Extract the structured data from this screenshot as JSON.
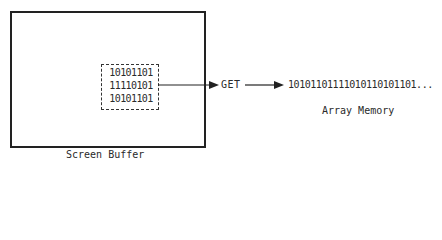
{
  "diagram": {
    "screen_buffer": {
      "label": "Screen Buffer",
      "selected_bits": [
        "10101101",
        "11110101",
        "10101101"
      ]
    },
    "operation": {
      "label": "GET"
    },
    "array_memory": {
      "label": "Array Memory",
      "contents": "10101101111010110101101..."
    },
    "colors": {
      "stroke": "#222222",
      "text": "#2a2a2a",
      "background": "#ffffff"
    }
  }
}
